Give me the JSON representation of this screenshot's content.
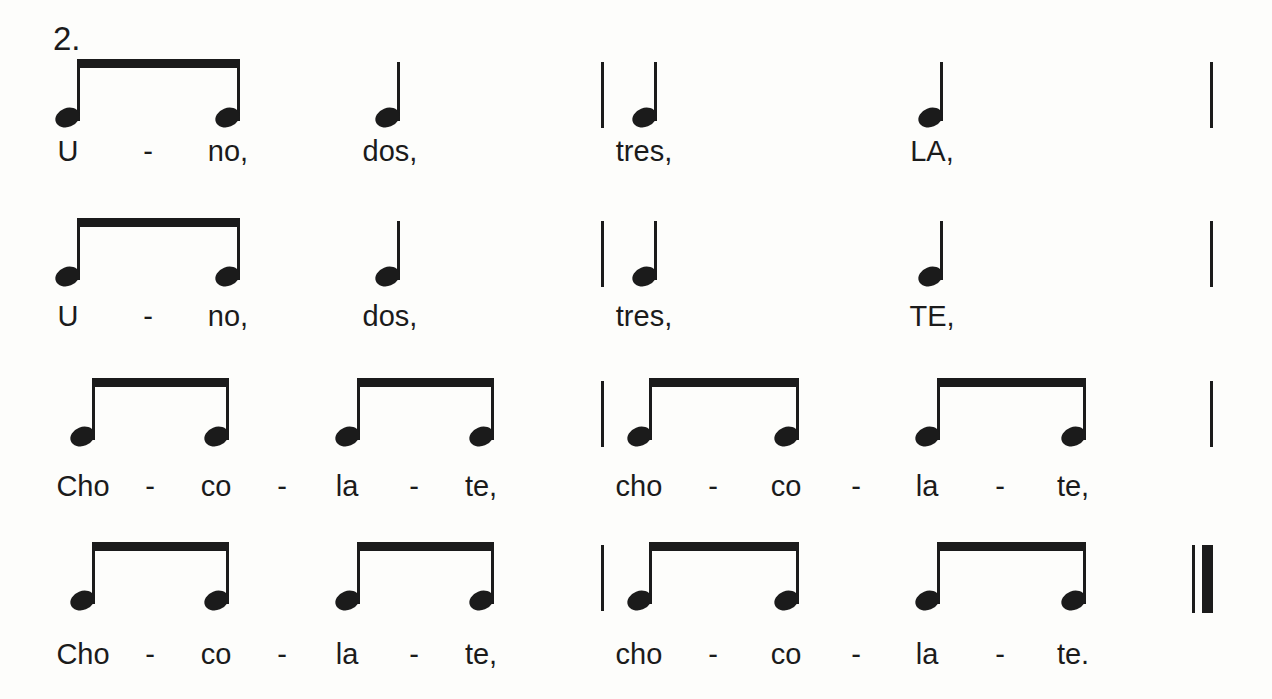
{
  "page": {
    "exercise_label": "2.",
    "ink_color": "#1b1b1b",
    "background_color": "#fdfdfb",
    "lyrics_text": [
      "U - no, dos, tres, LA,",
      "U - no, dos, tres, TE,",
      "Cho - co - la - te, cho - co - la - te,",
      "Cho - co - la - te, cho - co - la - te."
    ]
  },
  "notation": {
    "rows": [
      {
        "label": "line-1",
        "beam_y": 59,
        "lyric_y": 136,
        "events": [
          {
            "kind": "beamed_pair",
            "stems": [
              77,
              237
            ]
          },
          {
            "kind": "quarter",
            "stem": 397
          },
          {
            "kind": "barline",
            "style": "single",
            "x": 601
          },
          {
            "kind": "quarter",
            "stem": 654
          },
          {
            "kind": "quarter",
            "stem": 940
          },
          {
            "kind": "barline",
            "style": "single",
            "x": 1210
          }
        ],
        "lyrics": [
          {
            "text": "U",
            "cx": 68
          },
          {
            "text": "-",
            "cx": 148
          },
          {
            "text": "no,",
            "cx": 228
          },
          {
            "text": "dos,",
            "cx": 390
          },
          {
            "text": "tres,",
            "cx": 644
          },
          {
            "text": "LA,",
            "cx": 932
          }
        ]
      },
      {
        "label": "line-2",
        "beam_y": 218,
        "lyric_y": 301,
        "events": [
          {
            "kind": "beamed_pair",
            "stems": [
              77,
              237
            ]
          },
          {
            "kind": "quarter",
            "stem": 397
          },
          {
            "kind": "barline",
            "style": "single",
            "x": 601
          },
          {
            "kind": "quarter",
            "stem": 654
          },
          {
            "kind": "quarter",
            "stem": 940
          },
          {
            "kind": "barline",
            "style": "single",
            "x": 1210
          }
        ],
        "lyrics": [
          {
            "text": "U",
            "cx": 68
          },
          {
            "text": "-",
            "cx": 148
          },
          {
            "text": "no,",
            "cx": 228
          },
          {
            "text": "dos,",
            "cx": 390
          },
          {
            "text": "tres,",
            "cx": 644
          },
          {
            "text": "TE,",
            "cx": 932
          }
        ]
      },
      {
        "label": "line-3",
        "beam_y": 378,
        "lyric_y": 471,
        "events": [
          {
            "kind": "beamed_pair",
            "stems": [
              92,
              226
            ]
          },
          {
            "kind": "beamed_pair",
            "stems": [
              357,
              491
            ]
          },
          {
            "kind": "barline",
            "style": "single",
            "x": 601
          },
          {
            "kind": "beamed_pair",
            "stems": [
              649,
              796
            ]
          },
          {
            "kind": "beamed_pair",
            "stems": [
              937,
              1083
            ]
          },
          {
            "kind": "barline",
            "style": "single",
            "x": 1210
          }
        ],
        "lyrics": [
          {
            "text": "Cho",
            "cx": 83
          },
          {
            "text": "-",
            "cx": 150
          },
          {
            "text": "co",
            "cx": 216
          },
          {
            "text": "-",
            "cx": 282
          },
          {
            "text": "la",
            "cx": 347
          },
          {
            "text": "-",
            "cx": 414
          },
          {
            "text": "te,",
            "cx": 481
          },
          {
            "text": "cho",
            "cx": 639
          },
          {
            "text": "-",
            "cx": 713
          },
          {
            "text": "co",
            "cx": 786
          },
          {
            "text": "-",
            "cx": 856
          },
          {
            "text": "la",
            "cx": 927
          },
          {
            "text": "-",
            "cx": 1000
          },
          {
            "text": "te,",
            "cx": 1073
          }
        ]
      },
      {
        "label": "line-4",
        "beam_y": 542,
        "lyric_y": 639,
        "events": [
          {
            "kind": "beamed_pair",
            "stems": [
              92,
              226
            ]
          },
          {
            "kind": "beamed_pair",
            "stems": [
              357,
              491
            ]
          },
          {
            "kind": "barline",
            "style": "single",
            "x": 601
          },
          {
            "kind": "beamed_pair",
            "stems": [
              649,
              796
            ]
          },
          {
            "kind": "beamed_pair",
            "stems": [
              937,
              1083
            ]
          },
          {
            "kind": "barline",
            "style": "final",
            "x": 1192
          }
        ],
        "lyrics": [
          {
            "text": "Cho",
            "cx": 83
          },
          {
            "text": "-",
            "cx": 150
          },
          {
            "text": "co",
            "cx": 216
          },
          {
            "text": "-",
            "cx": 282
          },
          {
            "text": "la",
            "cx": 347
          },
          {
            "text": "-",
            "cx": 414
          },
          {
            "text": "te,",
            "cx": 481
          },
          {
            "text": "cho",
            "cx": 639
          },
          {
            "text": "-",
            "cx": 713
          },
          {
            "text": "co",
            "cx": 786
          },
          {
            "text": "-",
            "cx": 856
          },
          {
            "text": "la",
            "cx": 927
          },
          {
            "text": "-",
            "cx": 1000
          },
          {
            "text": "te.",
            "cx": 1073
          }
        ]
      }
    ]
  }
}
